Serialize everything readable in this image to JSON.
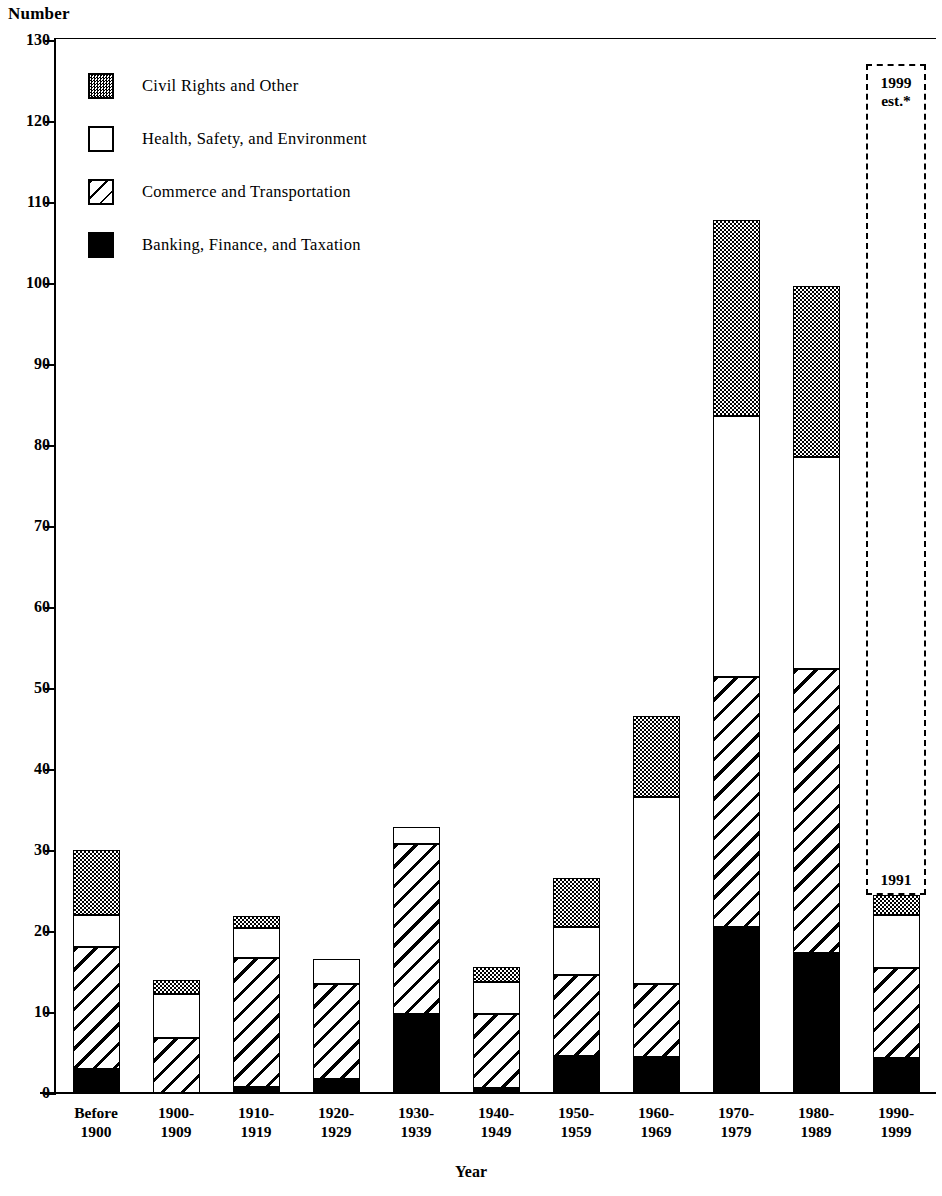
{
  "chart_data": {
    "type": "bar",
    "subtype": "stacked",
    "title": "",
    "ylabel": "Number",
    "xlabel": "Year",
    "ylim": [
      0,
      130
    ],
    "ytick_step": 10,
    "yticks": [
      0,
      10,
      20,
      30,
      40,
      50,
      60,
      70,
      80,
      90,
      100,
      110,
      120,
      130
    ],
    "grid": false,
    "legend_position": "upper-left-inside",
    "categories": [
      "Before\n1900",
      "1900-\n1909",
      "1910-\n1919",
      "1920-\n1929",
      "1930-\n1939",
      "1940-\n1949",
      "1950-\n1959",
      "1960-\n1969",
      "1970-\n1979",
      "1980-\n1989",
      "1990-\n1999"
    ],
    "series": [
      {
        "name": "Banking, Finance, and Taxation",
        "key": "banking",
        "pattern": "solid-black",
        "color": "#000000",
        "values": [
          3.0,
          0.0,
          0.7,
          1.7,
          9.7,
          0.6,
          4.6,
          4.5,
          20.5,
          17.3,
          4.3
        ]
      },
      {
        "name": "Commerce and Transportation",
        "key": "commerce",
        "pattern": "diagonal-hatch",
        "color": "#ffffff",
        "values": [
          15.0,
          6.8,
          16.0,
          11.8,
          21.0,
          9.1,
          10.0,
          8.9,
          30.8,
          35.0,
          11.1
        ]
      },
      {
        "name": "Health, Safety, and Environment",
        "key": "health",
        "pattern": "white",
        "color": "#ffffff",
        "values": [
          4.0,
          5.4,
          3.7,
          3.1,
          2.1,
          4.0,
          5.9,
          23.2,
          32.3,
          26.2,
          6.6
        ]
      },
      {
        "name": "Civil Rights and Other",
        "key": "civil",
        "pattern": "stipple-gray",
        "color": "#9a9a9a",
        "values": [
          8.0,
          1.7,
          1.4,
          0.0,
          0.0,
          1.9,
          6.1,
          9.9,
          24.2,
          21.1,
          2.5
        ]
      }
    ],
    "totals": [
      30.0,
      13.9,
      21.8,
      16.6,
      32.8,
      15.6,
      26.6,
      46.5,
      107.8,
      99.6,
      24.5
    ],
    "annotations": [
      {
        "text": "1999\nest.*",
        "target": "1990-1999",
        "style": "dashed-box"
      },
      {
        "text": "1991",
        "target": "1990-1999",
        "style": "bar-top-label"
      }
    ]
  },
  "axis": {
    "y_caption": "Number",
    "x_caption": "Year"
  },
  "legend": {
    "items": [
      {
        "label": "Civil Rights and Other",
        "key": "civil"
      },
      {
        "label": "Health, Safety, and Environment",
        "key": "health"
      },
      {
        "label": "Commerce and Transportation",
        "key": "commerce"
      },
      {
        "label": "Banking, Finance, and Taxation",
        "key": "banking"
      }
    ]
  }
}
